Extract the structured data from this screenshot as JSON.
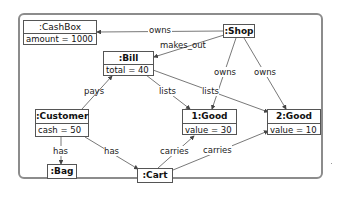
{
  "diagram": {
    "type": "uml-object-diagram",
    "nodes": {
      "cashbox": {
        "title": ":CashBox",
        "attr": "amount = 1000"
      },
      "shop": {
        "title": ":Shop"
      },
      "bill": {
        "title": ":Bill",
        "attr": "total = 40"
      },
      "customer": {
        "title": ":Customer",
        "attr": "cash = 50"
      },
      "good1": {
        "title": "1:Good",
        "attr": "value = 30"
      },
      "good2": {
        "title": "2:Good",
        "attr": "value = 10"
      },
      "bag": {
        "title": ":Bag"
      },
      "cart": {
        "title": ":Cart"
      }
    },
    "edges": [
      {
        "id": "shop-owns-cashbox",
        "from": ":Shop",
        "to": ":CashBox",
        "label": "owns"
      },
      {
        "id": "shop-makes-bill",
        "from": ":Shop",
        "to": ":Bill",
        "label": "makes_out"
      },
      {
        "id": "shop-owns-good1",
        "from": ":Shop",
        "to": "1:Good",
        "label": "owns"
      },
      {
        "id": "shop-owns-good2",
        "from": ":Shop",
        "to": "2:Good",
        "label": "owns"
      },
      {
        "id": "customer-pays-bill",
        "from": ":Customer",
        "to": ":Bill",
        "label": "pays"
      },
      {
        "id": "bill-lists-good1",
        "from": ":Bill",
        "to": "1:Good",
        "label": "lists"
      },
      {
        "id": "bill-lists-good2",
        "from": ":Bill",
        "to": "2:Good",
        "label": "lists"
      },
      {
        "id": "customer-has-bag",
        "from": ":Customer",
        "to": ":Bag",
        "label": "has"
      },
      {
        "id": "customer-has-cart",
        "from": ":Customer",
        "to": ":Cart",
        "label": "has"
      },
      {
        "id": "cart-carries-good1",
        "from": ":Cart",
        "to": "1:Good",
        "label": "carries"
      },
      {
        "id": "cart-carries-good2",
        "from": ":Cart",
        "to": "2:Good",
        "label": "carries"
      }
    ],
    "colors": {
      "frame": "#8c8c8c",
      "node_border": "#555555",
      "edge": "#555555"
    }
  }
}
